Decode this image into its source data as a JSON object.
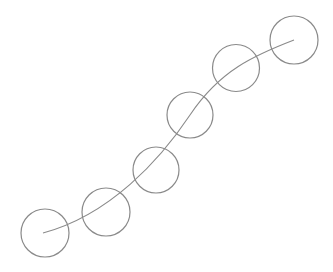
{
  "diagram": {
    "background": "#ffffff",
    "stroke_color": "#8a8a8a",
    "path": {
      "d": "M 43 233 C 110 215, 160 160, 190 115 S 255 55, 294 40"
    },
    "nodes": [
      {
        "cx": 45,
        "cy": 233,
        "r": 24
      },
      {
        "cx": 106,
        "cy": 212,
        "r": 24
      },
      {
        "cx": 156,
        "cy": 170,
        "r": 23
      },
      {
        "cx": 190,
        "cy": 115,
        "r": 23
      },
      {
        "cx": 236,
        "cy": 68,
        "r": 23.5
      },
      {
        "cx": 294,
        "cy": 40,
        "r": 24
      }
    ]
  }
}
